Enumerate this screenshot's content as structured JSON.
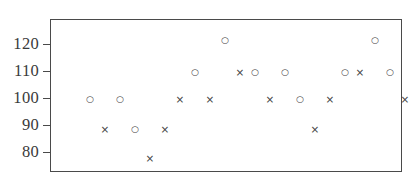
{
  "chart_data": {
    "type": "scatter",
    "title": "",
    "subtitle": "",
    "xlabel": "",
    "ylabel": "",
    "xlim": [
      0,
      23
    ],
    "ylim": [
      73,
      129
    ],
    "grid": false,
    "legend": null,
    "y_ticks": [
      {
        "label": "120",
        "value": 120
      },
      {
        "label": "110",
        "value": 110
      },
      {
        "label": "100",
        "value": 100
      },
      {
        "label": "90",
        "value": 90
      },
      {
        "label": "80",
        "value": 80
      }
    ],
    "x_ticks": [],
    "markers": {
      "circle": "○",
      "cross": "×"
    },
    "series": [
      {
        "name": "circle",
        "marker": "circle",
        "points": [
          {
            "x": 1,
            "y": 100
          },
          {
            "x": 3,
            "y": 100
          },
          {
            "x": 4,
            "y": 89
          },
          {
            "x": 8,
            "y": 110
          },
          {
            "x": 10,
            "y": 122
          },
          {
            "x": 12,
            "y": 110
          },
          {
            "x": 14,
            "y": 110
          },
          {
            "x": 15,
            "y": 100
          },
          {
            "x": 18,
            "y": 110
          },
          {
            "x": 20,
            "y": 122
          },
          {
            "x": 21,
            "y": 110
          }
        ]
      },
      {
        "name": "cross",
        "marker": "cross",
        "points": [
          {
            "x": 2,
            "y": 89
          },
          {
            "x": 5,
            "y": 78
          },
          {
            "x": 6,
            "y": 89
          },
          {
            "x": 7,
            "y": 100
          },
          {
            "x": 9,
            "y": 100
          },
          {
            "x": 11,
            "y": 110
          },
          {
            "x": 13,
            "y": 100
          },
          {
            "x": 16,
            "y": 89
          },
          {
            "x": 17,
            "y": 100
          },
          {
            "x": 19,
            "y": 110
          },
          {
            "x": 22,
            "y": 100
          }
        ]
      }
    ],
    "all_points_in_order": [
      {
        "x": 1,
        "y": 100,
        "marker": "circle"
      },
      {
        "x": 2,
        "y": 89,
        "marker": "cross"
      },
      {
        "x": 3,
        "y": 100,
        "marker": "circle"
      },
      {
        "x": 4,
        "y": 89,
        "marker": "circle"
      },
      {
        "x": 5,
        "y": 78,
        "marker": "cross"
      },
      {
        "x": 6,
        "y": 89,
        "marker": "cross"
      },
      {
        "x": 7,
        "y": 100,
        "marker": "cross"
      },
      {
        "x": 8,
        "y": 110,
        "marker": "circle"
      },
      {
        "x": 9,
        "y": 100,
        "marker": "cross"
      },
      {
        "x": 10,
        "y": 122,
        "marker": "circle"
      },
      {
        "x": 11,
        "y": 110,
        "marker": "cross"
      },
      {
        "x": 12,
        "y": 110,
        "marker": "circle"
      },
      {
        "x": 13,
        "y": 100,
        "marker": "cross"
      },
      {
        "x": 14,
        "y": 110,
        "marker": "circle"
      },
      {
        "x": 15,
        "y": 100,
        "marker": "circle"
      },
      {
        "x": 16,
        "y": 89,
        "marker": "cross"
      },
      {
        "x": 17,
        "y": 100,
        "marker": "cross"
      },
      {
        "x": 18,
        "y": 110,
        "marker": "circle"
      },
      {
        "x": 20,
        "y": 122,
        "marker": "circle"
      },
      {
        "x": 19,
        "y": 110,
        "marker": "cross"
      },
      {
        "x": 21,
        "y": 110,
        "marker": "circle"
      },
      {
        "x": 22,
        "y": 100,
        "marker": "cross"
      }
    ]
  },
  "colors": {
    "marker": "#3f3f3f",
    "axis": "#4a4a4a",
    "label": "#3a3a3a",
    "background": "#ffffff"
  }
}
